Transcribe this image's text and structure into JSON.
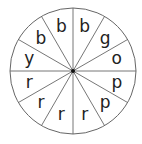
{
  "spinner": {
    "center": [
      73,
      71
    ],
    "radius": 63,
    "sector_count": 12,
    "start_angle_deg": 0,
    "direction": "clockwise-from-top",
    "stroke_color": "#666666",
    "fill_color": "#ffffff",
    "text_color": "#222222",
    "center_dot_color": "#111111",
    "label_radius_ratio": 0.72,
    "sectors": [
      {
        "label": "b"
      },
      {
        "label": "g"
      },
      {
        "label": "o"
      },
      {
        "label": "p"
      },
      {
        "label": "p"
      },
      {
        "label": "r"
      },
      {
        "label": "r"
      },
      {
        "label": "r"
      },
      {
        "label": "r"
      },
      {
        "label": "y"
      },
      {
        "label": "b"
      },
      {
        "label": "b"
      }
    ]
  }
}
